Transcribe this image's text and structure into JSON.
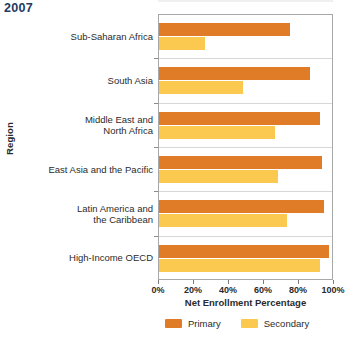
{
  "year_label": "2007",
  "legend": {
    "items": [
      {
        "label": "Primary",
        "color": "#e07b28"
      },
      {
        "label": "Secondary",
        "color": "#fbc950"
      }
    ]
  },
  "axes": {
    "x_title": "Net Enrollment Percentage",
    "y_title": "Region",
    "x_ticks": [
      "0%",
      "20%",
      "40%",
      "60%",
      "80%",
      "100%"
    ]
  },
  "chart_data": {
    "type": "bar",
    "orientation": "horizontal",
    "title": "2007",
    "xlabel": "Net Enrollment Percentage",
    "ylabel": "Region",
    "xlim": [
      0,
      100
    ],
    "xticks": [
      0,
      20,
      40,
      60,
      80,
      100
    ],
    "xtick_labels": [
      "0%",
      "20%",
      "40%",
      "60%",
      "80%",
      "100%"
    ],
    "grid": false,
    "legend_position": "bottom",
    "categories": [
      "Sub-Saharan Africa",
      "South Asia",
      "Middle East and North Africa",
      "East Asia and the Pacific",
      "Latin America and the Caribbean",
      "High-Income OECD"
    ],
    "series": [
      {
        "name": "Primary",
        "color": "#e07b28",
        "values": [
          75,
          86,
          92,
          93,
          94,
          97
        ]
      },
      {
        "name": "Secondary",
        "color": "#fbc950",
        "values": [
          26,
          48,
          66,
          68,
          73,
          92
        ]
      }
    ]
  },
  "category_label_lines": [
    [
      "Sub-Saharan Africa"
    ],
    [
      "South Asia"
    ],
    [
      "Middle East and",
      "North Africa"
    ],
    [
      "East Asia and the Pacific"
    ],
    [
      "Latin America and",
      "the Caribbean"
    ],
    [
      "High-Income OECD"
    ]
  ]
}
